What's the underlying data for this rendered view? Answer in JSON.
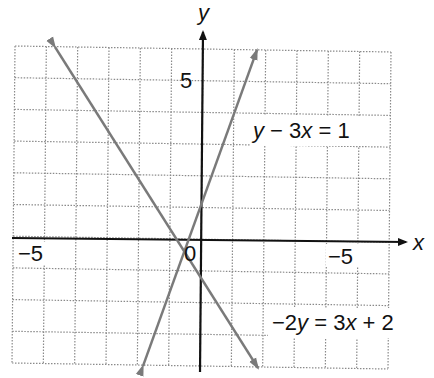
{
  "chart_data": {
    "type": "line",
    "title": "",
    "xlabel": "x",
    "ylabel": "y",
    "xlim": [
      -6,
      6
    ],
    "ylim": [
      -4,
      6
    ],
    "grid": true,
    "grid_style": "dotted",
    "tick_labels": {
      "x_left": "−5",
      "x_right": "−5",
      "origin": "0",
      "y_top": "5"
    },
    "series": [
      {
        "name": "y − 3x = 1",
        "equation": "y = 3x + 1",
        "slope": 3,
        "intercept": 1,
        "x": [
          -1.83,
          1.78
        ],
        "y": [
          -4.5,
          6.3
        ],
        "color": "#7a7a7a"
      },
      {
        "name": "−2y = 3x + 2",
        "equation": "y = -1.5x - 1",
        "slope": -1.5,
        "intercept": -1,
        "x": [
          -4.63,
          1.81
        ],
        "y": [
          5.95,
          -3.7
        ],
        "color": "#7a7a7a"
      }
    ],
    "annotations": [
      {
        "text": "y − 3x = 1",
        "position": "upper right"
      },
      {
        "text": "−2y = 3x + 2",
        "position": "lower right"
      }
    ]
  },
  "labels": {
    "x_axis_name": "x",
    "y_axis_name": "y",
    "x_tick_left": "−5",
    "x_tick_right": "−5",
    "origin": "0",
    "y_tick_top": "5",
    "eq1_parts": {
      "a": "y",
      "b": " − 3",
      "c": "x",
      "d": " = 1"
    },
    "eq2_parts": {
      "a": "−2",
      "b": "y",
      "c": " = 3",
      "d": "x",
      "e": " + 2"
    }
  }
}
